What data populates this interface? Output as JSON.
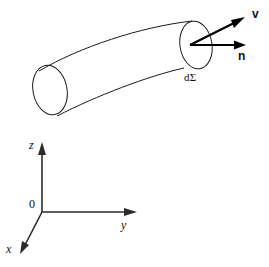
{
  "figure": {
    "background_color": "#ffffff",
    "line_color": "#1a1a1a",
    "vector_color": "#000000",
    "axis_color": "#2b2b2b",
    "width": 269,
    "height": 267
  },
  "tube": {
    "name": "flow-tube",
    "left_cap": {
      "cx": 50,
      "cy": 90,
      "rx": 17,
      "ry": 25
    },
    "right_cap": {
      "cx": 196,
      "cy": 45,
      "rx": 16,
      "ry": 24
    }
  },
  "labels": {
    "velocity_vector": "v",
    "normal_vector": "n",
    "surface_element": "dΣ",
    "axis_z": "z",
    "axis_y": "y",
    "axis_x": "x",
    "origin": "0"
  },
  "vectors": [
    {
      "name": "velocity",
      "label": "v",
      "from": [
        190,
        45
      ],
      "to": [
        243,
        19
      ]
    },
    {
      "name": "normal",
      "label": "n",
      "from": [
        190,
        45
      ],
      "to": [
        243,
        45
      ]
    }
  ],
  "axes": [
    {
      "name": "z-axis",
      "label": "z",
      "from": [
        42,
        212
      ],
      "to": [
        42,
        143
      ]
    },
    {
      "name": "y-axis",
      "label": "y",
      "from": [
        42,
        212
      ],
      "to": [
        136,
        212
      ]
    },
    {
      "name": "x-axis",
      "label": "x",
      "from": [
        42,
        212
      ],
      "to": [
        21,
        253
      ]
    }
  ]
}
